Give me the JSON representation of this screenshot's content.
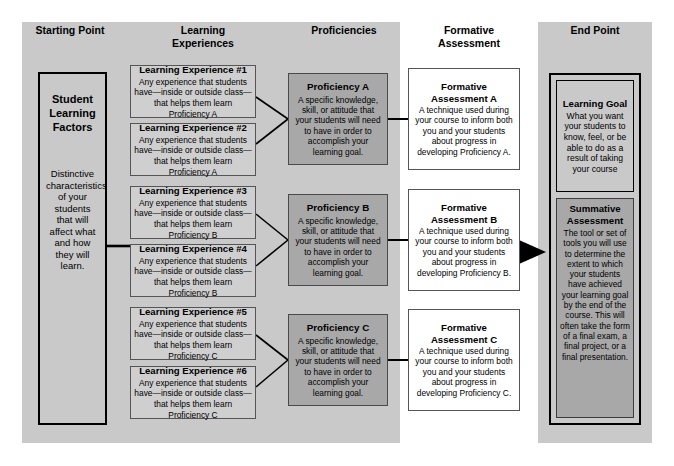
{
  "columns": [
    {
      "id": "starting-point",
      "label": "Starting Point"
    },
    {
      "id": "learning-experiences",
      "label": "Learning\nExperiences"
    },
    {
      "id": "proficiencies",
      "label": "Proficiencies"
    },
    {
      "id": "formative-assessment",
      "label": "Formative\nAssessment"
    },
    {
      "id": "end-point",
      "label": "End Point"
    }
  ],
  "headers": {
    "starting_point": "Starting Point",
    "learning_experiences_l1": "Learning",
    "learning_experiences_l2": "Experiences",
    "proficiencies": "Proficiencies",
    "formative_assessment_l1": "Formative",
    "formative_assessment_l2": "Assessment",
    "end_point": "End Point"
  },
  "starting_point": {
    "title_l1": "Student",
    "title_l2": "Learning",
    "title_l3": "Factors",
    "body": "Distinctive characteristics of your students that will affect what and how they will learn."
  },
  "learning_experiences": [
    {
      "title": "Learning Experience #1",
      "body": "Any experience that students have—inside or outside class—that helps them learn Proficiency A"
    },
    {
      "title": "Learning Experience #2",
      "body": "Any experience that students have—inside or outside class—that helps them learn Proficiency A"
    },
    {
      "title": "Learning Experience #3",
      "body": "Any experience that students have—inside or outside class—that helps them learn Proficiency B"
    },
    {
      "title": "Learning Experience #4",
      "body": "Any experience that students have—inside or outside class—that helps them learn Proficiency B"
    },
    {
      "title": "Learning Experience #5",
      "body": "Any experience that students have—inside or outside class—that helps them learn Proficiency C"
    },
    {
      "title": "Learning Experience #6",
      "body": "Any experience that students have—inside or outside class—that helps them learn Proficiency C"
    }
  ],
  "proficiencies": [
    {
      "title": "Proficiency A",
      "body": "A specific knowledge, skill, or attitude that your students will need to have in order to accomplish your learning goal."
    },
    {
      "title": "Proficiency B",
      "body": "A specific knowledge, skill, or attitude that your students will need to have in order to accomplish your learning goal."
    },
    {
      "title": "Proficiency C",
      "body": "A specific knowledge, skill, or attitude that your students will need to have in order to accomplish your learning goal."
    }
  ],
  "formative_assessments": [
    {
      "title_l1": "Formative",
      "title_l2": "Assessment A",
      "body": "A technique used during your course to inform both you and your students about progress in developing Proficiency A."
    },
    {
      "title_l1": "Formative",
      "title_l2": "Assessment B",
      "body": "A technique used during your course to inform both you and your students about progress in developing Proficiency B."
    },
    {
      "title_l1": "Formative",
      "title_l2": "Assessment C",
      "body": "A technique used during your course to inform both you and your students about progress in developing Proficiency C."
    }
  ],
  "end_point": {
    "learning_goal": {
      "title": "Learning Goal",
      "body": "What you want your students to know, feel, or be able to do as a result of taking your course"
    },
    "summative_assessment": {
      "title_l1": "Summative",
      "title_l2": "Assessment",
      "body": "The tool or set of tools you will use to determine the extent to which your students have achieved your learning goal by the end of the course. This will often take the form of a final exam, a final project, or a final presentation."
    }
  },
  "colors": {
    "band_gray": "#c9c9c9",
    "box_light_gray": "#cfcfcf",
    "box_dark_gray": "#a8a8a8",
    "box_white": "#ffffff",
    "line_black": "#000000"
  }
}
